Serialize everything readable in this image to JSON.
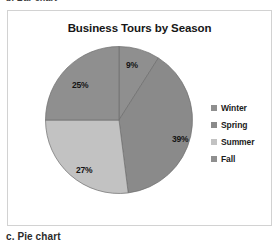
{
  "figure": {
    "caption_above_cut": "b. Bar chart",
    "caption_below": "c. Pie chart"
  },
  "chart_data": {
    "type": "pie",
    "title": "Business Tours by Season",
    "categories": [
      "Winter",
      "Spring",
      "Summer",
      "Fall"
    ],
    "values": [
      9,
      39,
      27,
      25
    ],
    "value_labels": [
      "9%",
      "39%",
      "27%",
      "25%"
    ],
    "unit": "%",
    "start_angle_deg": 0,
    "direction": "clockwise",
    "legend_position": "right",
    "grid": false,
    "colors": [
      "#8f8f8f",
      "#8a8a8a",
      "#c2c2c2",
      "#8f8f8f"
    ],
    "slice_colors": {
      "winter": "#8f8f8f",
      "spring": "#8a8a8a",
      "summer": "#c2c2c2",
      "fall": "#8f8f8f"
    },
    "frame_border_color": "#d2d2d2",
    "label_color": "#141414"
  },
  "legend": {
    "items": [
      {
        "label": "Winter",
        "swatch": "#8f8f8f"
      },
      {
        "label": "Spring",
        "swatch": "#8a8a8a"
      },
      {
        "label": "Summer",
        "swatch": "#c2c2c2"
      },
      {
        "label": "Fall",
        "swatch": "#8f8f8f"
      }
    ]
  }
}
